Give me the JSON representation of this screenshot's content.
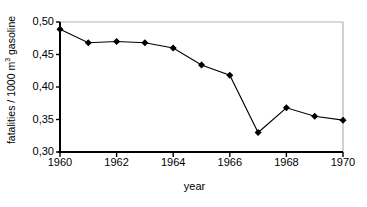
{
  "chart_data": {
    "type": "line",
    "title": "",
    "subtitle": "",
    "xlabel": "year",
    "ylabel": "fatalities / 1000 m3 gasoline",
    "ylabel_parts": {
      "pre": "fatalities / 1000 m",
      "sup": "3",
      "post": " gasoline"
    },
    "x": [
      1960,
      1961,
      1962,
      1963,
      1964,
      1965,
      1966,
      1967,
      1968,
      1969,
      1970
    ],
    "values": [
      0.489,
      0.468,
      0.47,
      0.468,
      0.46,
      0.434,
      0.418,
      0.33,
      0.368,
      0.355,
      0.349
    ],
    "series": [
      {
        "name": "fatalities per 1000 m3 gasoline",
        "values": [
          0.489,
          0.468,
          0.47,
          0.468,
          0.46,
          0.434,
          0.418,
          0.33,
          0.368,
          0.355,
          0.349
        ]
      }
    ],
    "xlim": [
      1960,
      1970
    ],
    "ylim": [
      0.3,
      0.5
    ],
    "xticks": [
      1960,
      1962,
      1964,
      1966,
      1968,
      1970
    ],
    "xtick_labels": [
      "1960",
      "1962",
      "1964",
      "1966",
      "1968",
      "1970"
    ],
    "yticks": [
      0.3,
      0.35,
      0.4,
      0.45,
      0.5
    ],
    "ytick_labels": [
      "0,30",
      "0,35",
      "0,40",
      "0,45",
      "0,50"
    ],
    "grid": false,
    "legend": "none",
    "marker": "filled-diamond",
    "line_color": "#000000",
    "marker_color": "#000000",
    "axis_color": "#000000",
    "frame_color": "#b3b3b3",
    "background": "#ffffff"
  },
  "axes": {
    "y_title_full": "fatalities / 1000 m3 gasoline",
    "x_title": "year"
  }
}
